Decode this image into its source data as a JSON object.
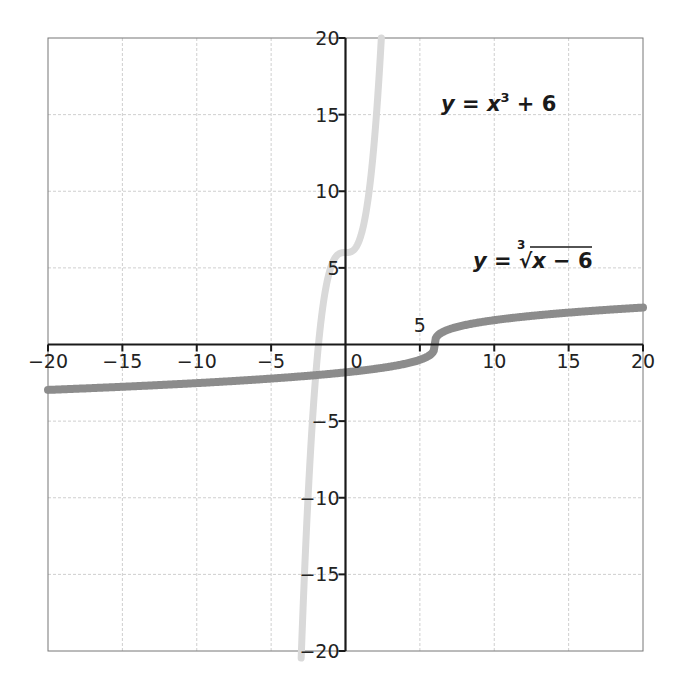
{
  "chart_data": {
    "type": "line",
    "title": "",
    "xlabel": "",
    "ylabel": "",
    "xlim": [
      -20,
      20
    ],
    "ylim": [
      -20,
      20
    ],
    "grid": true,
    "legend": "none (curves labeled inline)",
    "x_ticks": [
      -20,
      -15,
      -10,
      -5,
      0,
      5,
      10,
      15,
      20
    ],
    "y_ticks": [
      -20,
      -15,
      -10,
      -5,
      5,
      10,
      15,
      20
    ],
    "x_tick_labels": [
      "−20",
      "−15",
      "−10",
      "−5",
      "0",
      "5",
      "10",
      "15",
      "20"
    ],
    "y_tick_labels": [
      "20",
      "15",
      "10",
      "5",
      "−5",
      "−10",
      "−15",
      "−20"
    ],
    "series": [
      {
        "name": "y = x³ + 6",
        "function": "x^3 + 6",
        "color": "#d9d9d9",
        "x": [
          -2.98,
          -2.8,
          -2.5,
          -2.2,
          -2.0,
          -1.8,
          -1.5,
          -1.2,
          -1.0,
          -0.6,
          0,
          0.6,
          1.0,
          1.2,
          1.5,
          1.8,
          2.0,
          2.2,
          2.41
        ],
        "y": [
          -20.5,
          -15.95,
          -9.63,
          -4.65,
          -2.0,
          0.17,
          2.63,
          4.27,
          5.0,
          5.78,
          6.0,
          6.22,
          7.0,
          7.73,
          9.38,
          11.83,
          14.0,
          16.65,
          20.0
        ]
      },
      {
        "name": "y = ∛(x − 6)",
        "function": "cbrt(x - 6)",
        "color": "#8c8c8c",
        "x": [
          -20,
          -15,
          -10,
          -5,
          0,
          3,
          5,
          5.8,
          6,
          6.2,
          7,
          10,
          15,
          20
        ],
        "y": [
          -2.96,
          -2.76,
          -2.52,
          -2.22,
          -1.82,
          -1.44,
          -1.0,
          -0.58,
          0,
          0.58,
          1.0,
          1.59,
          2.08,
          2.41
        ]
      }
    ],
    "annotations": [
      {
        "text": "y = x³ + 6",
        "x": 7.5,
        "y": 14.5
      },
      {
        "text": "y = ∛(x − 6)",
        "x": 10,
        "y": 5
      }
    ]
  },
  "labels": {
    "eq1_y": "y",
    "eq1_eq": " = ",
    "eq1_x": "x",
    "eq1_exp": "3",
    "eq1_rest": " + 6",
    "eq2_y": "y",
    "eq2_eq": " = ",
    "eq2_index": "3",
    "eq2_radical": "√",
    "eq2_x": "x",
    "eq2_rest": " − 6"
  },
  "style": {
    "light_curve_color": "#d9d9d9",
    "dark_curve_color": "#8c8c8c",
    "grid_color": "#cfcfcf",
    "axis_color": "#1a1a1a"
  }
}
